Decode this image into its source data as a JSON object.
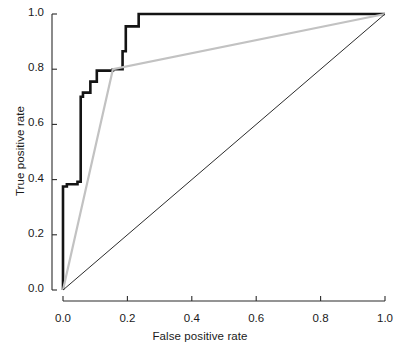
{
  "chart_data": {
    "type": "line",
    "title": "",
    "subtitle": "",
    "xlabel": "False positive rate",
    "ylabel": "True positive rate",
    "xlim": [
      0.0,
      1.0
    ],
    "ylim": [
      0.0,
      1.0
    ],
    "xticks": [
      0.0,
      0.2,
      0.4,
      0.6,
      0.8,
      1.0
    ],
    "yticks": [
      0.0,
      0.2,
      0.4,
      0.6,
      0.8,
      1.0
    ],
    "xtick_labels": [
      "0.0",
      "0.2",
      "0.4",
      "0.6",
      "0.8",
      "1.0"
    ],
    "ytick_labels": [
      "0.0",
      "0.2",
      "0.4",
      "0.6",
      "0.8",
      "1.0"
    ],
    "grid": false,
    "legend": "none",
    "annotations": [],
    "series": [
      {
        "name": "roc-step-curve",
        "style": "step",
        "color": "#141414",
        "width": 2.6,
        "x": [
          0.0,
          0.0,
          0.012,
          0.012,
          0.045,
          0.045,
          0.055,
          0.055,
          0.055,
          0.062,
          0.062,
          0.085,
          0.085,
          0.105,
          0.105,
          0.155,
          0.155,
          0.185,
          0.185,
          0.195,
          0.195,
          0.235,
          0.235,
          1.0
        ],
        "y": [
          0.0,
          0.375,
          0.375,
          0.383,
          0.383,
          0.392,
          0.392,
          0.7,
          0.7,
          0.7,
          0.715,
          0.715,
          0.755,
          0.755,
          0.795,
          0.795,
          0.8,
          0.8,
          0.865,
          0.865,
          0.955,
          0.955,
          1.0,
          1.0
        ]
      },
      {
        "name": "roc-gray-curve",
        "style": "line",
        "color": "#c2c2c2",
        "width": 2.2,
        "x": [
          0.0,
          0.155,
          1.0
        ],
        "y": [
          0.0,
          0.8,
          1.0
        ]
      },
      {
        "name": "chance-diagonal",
        "style": "line",
        "color": "#2b2b2b",
        "width": 1.0,
        "x": [
          0.0,
          1.0
        ],
        "y": [
          0.0,
          1.0
        ]
      }
    ]
  },
  "axes": {
    "x_title": "False positive rate",
    "y_title": "True positive rate"
  }
}
